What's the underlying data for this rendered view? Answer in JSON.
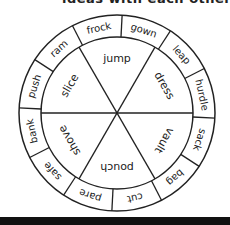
{
  "header": {
    "text": "ideas with each other"
  },
  "wheel": {
    "center": [
      117,
      113
    ],
    "outer_radius": 98,
    "inner_radius": 76,
    "rotation_deg": 3,
    "line_color": "#222222",
    "outer_words": [
      "gown",
      "leap",
      "hurdle",
      "sack",
      "bag",
      "cut",
      "pare",
      "safe",
      "bank",
      "push",
      "ram",
      "frock"
    ],
    "inner_words": [
      "jump",
      "dress",
      "vault",
      "pouch",
      "shove",
      "slice"
    ]
  }
}
